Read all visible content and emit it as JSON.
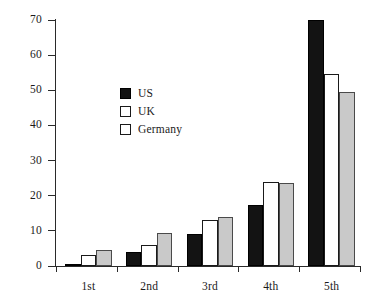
{
  "chart_data": {
    "type": "bar",
    "title": "",
    "subtitle": "",
    "xlabel": "",
    "ylabel": "",
    "categories": [
      "1st",
      "2nd",
      "3rd",
      "4th",
      "5th"
    ],
    "series": [
      {
        "name": "US",
        "color": "#131313",
        "values": [
          0.5,
          4,
          9,
          17.5,
          70
        ]
      },
      {
        "name": "UK",
        "color": "#ffffff",
        "values": [
          3,
          6,
          13,
          24,
          54.5
        ]
      },
      {
        "name": "Germany",
        "color": "#c9c9c9",
        "values": [
          4.5,
          9.5,
          14,
          23.5,
          49.5
        ]
      }
    ],
    "ylim": [
      0,
      70
    ],
    "yticks": [
      0,
      10,
      20,
      30,
      40,
      50,
      60,
      70
    ],
    "ytick_labels": [
      "0",
      "10",
      "20",
      "30",
      "40",
      "50",
      "60",
      "70"
    ],
    "grid": false,
    "legend_position": "upper-left-inside",
    "legend_entries": [
      "US",
      "UK",
      "Germany"
    ]
  }
}
